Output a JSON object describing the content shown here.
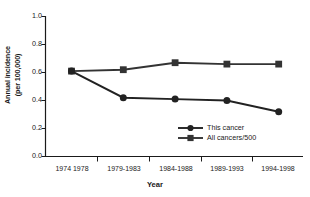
{
  "chart_data": {
    "type": "line",
    "title": "",
    "xlabel": "Year",
    "ylabel_line1": "Annual incidence",
    "ylabel_line2": "(per 100,000)",
    "categories": [
      "1974 1978",
      "1979-1983",
      "1984-1988",
      "1989-1993",
      "1994-1998"
    ],
    "ylim": [
      0.0,
      1.0
    ],
    "ytick_labels": [
      "1.0",
      "0.8",
      "0.6",
      "0.4",
      "0.2",
      "0.0"
    ],
    "ytick_values": [
      1.0,
      0.8,
      0.6,
      0.4,
      0.2,
      0.0
    ],
    "grid": false,
    "legend_position": "inside-right",
    "series": [
      {
        "name": "This cancer",
        "marker": "circle",
        "color": "#222222",
        "values": [
          0.61,
          0.42,
          0.41,
          0.4,
          0.32
        ]
      },
      {
        "name": "All cancers/500",
        "marker": "square",
        "color": "#333333",
        "values": [
          0.61,
          0.62,
          0.67,
          0.66,
          0.66
        ]
      }
    ]
  },
  "axes": {
    "axis_color": "#1a1a1a"
  }
}
